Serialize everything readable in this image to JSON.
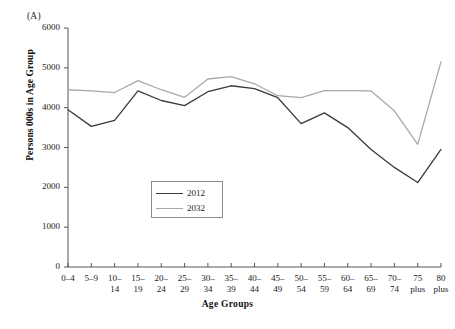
{
  "panel": {
    "label": "(A)"
  },
  "axes": {
    "ylabel": "Persons 000s in Age Group",
    "xlabel": "Age Groups",
    "yticks": [
      "0",
      "1000",
      "2000",
      "3000",
      "4000",
      "5000",
      "6000"
    ],
    "ylim": [
      0,
      6000
    ]
  },
  "legend": {
    "items": [
      {
        "label": "2012",
        "color": "#3a3a3a"
      },
      {
        "label": "2032",
        "color": "#a9a9a9"
      }
    ]
  },
  "chart_data": {
    "type": "line",
    "title": "(A)",
    "xlabel": "Age Groups",
    "ylabel": "Persons 000s in Age Group",
    "ylim": [
      0,
      6000
    ],
    "ytick_step": 1000,
    "grid": false,
    "legend_position": "center-left-inside",
    "categories": [
      "0–4",
      "5–9",
      "10–14",
      "15–19",
      "20–24",
      "25–29",
      "30–34",
      "35–39",
      "40–44",
      "45–49",
      "50–54",
      "55–59",
      "60–64",
      "65–69",
      "70–74",
      "75 plus",
      "80 plus"
    ],
    "category_lines": [
      [
        "0–4",
        ""
      ],
      [
        "5–9",
        ""
      ],
      [
        "10–",
        "14"
      ],
      [
        "15–",
        "19"
      ],
      [
        "20–",
        "24"
      ],
      [
        "25–",
        "29"
      ],
      [
        "30–",
        "34"
      ],
      [
        "35–",
        "39"
      ],
      [
        "40–",
        "44"
      ],
      [
        "45–",
        "49"
      ],
      [
        "50–",
        "54"
      ],
      [
        "55–",
        "59"
      ],
      [
        "60–",
        "64"
      ],
      [
        "65–",
        "69"
      ],
      [
        "70–",
        "74"
      ],
      [
        "75",
        "plus"
      ],
      [
        "80",
        "plus"
      ]
    ],
    "series": [
      {
        "name": "2012",
        "color": "#3a3a3a",
        "values": [
          3950,
          3530,
          3680,
          4420,
          4180,
          4050,
          4400,
          4550,
          4480,
          4250,
          3600,
          3870,
          3500,
          2950,
          2500,
          2120,
          2950
        ]
      },
      {
        "name": "2032",
        "color": "#a9a9a9",
        "values": [
          4450,
          4420,
          4380,
          4680,
          4450,
          4260,
          4720,
          4780,
          4600,
          4300,
          4250,
          4430,
          4430,
          4420,
          3920,
          3080,
          5150
        ]
      }
    ]
  }
}
